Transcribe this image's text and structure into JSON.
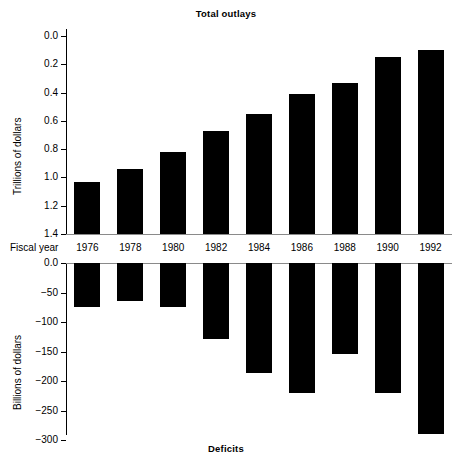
{
  "chart_data": [
    {
      "type": "bar",
      "title": "Total outlays",
      "xlabel": "Fiscal year",
      "ylabel": "Trillions of dollars",
      "categories": [
        "1976",
        "1978",
        "1980",
        "1982",
        "1984",
        "1986",
        "1988",
        "1990",
        "1992"
      ],
      "values": [
        0.37,
        0.46,
        0.58,
        0.73,
        0.85,
        0.99,
        1.07,
        1.25,
        1.3
      ],
      "yticks": [
        "0.0",
        "0.2",
        "0.4",
        "0.6",
        "0.8",
        "1.0",
        "1.2",
        "1.4"
      ],
      "ytick_values": [
        0.0,
        0.2,
        0.4,
        0.6,
        0.8,
        1.0,
        1.2,
        1.4
      ],
      "ylim": [
        0.0,
        1.5
      ],
      "grid": false,
      "legend": "none",
      "bar_color": "#000000"
    },
    {
      "type": "bar",
      "title": "Deficits",
      "xlabel": "Fiscal year",
      "ylabel": "Billions of dollars",
      "categories": [
        "1976",
        "1978",
        "1980",
        "1982",
        "1984",
        "1986",
        "1988",
        "1990",
        "1992"
      ],
      "values": [
        -74,
        -64,
        -74,
        -128,
        -186,
        -221,
        -155,
        -221,
        -290
      ],
      "yticks": [
        "0.0",
        "−50",
        "−100",
        "−150",
        "−200",
        "−250",
        "−300"
      ],
      "ytick_values": [
        0,
        -50,
        -100,
        -150,
        -200,
        -250,
        -300
      ],
      "ylim": [
        -310,
        0
      ],
      "grid": false,
      "legend": "none",
      "bar_color": "#000000"
    }
  ],
  "top": {
    "title": "Total outlays",
    "ylabel": "Trillions of dollars",
    "yticks": [
      "1.4",
      "1.2",
      "1.0",
      "0.8",
      "0.6",
      "0.4",
      "0.2",
      "0.0"
    ]
  },
  "bottom": {
    "title": "Deficits",
    "ylabel": "Billions of dollars",
    "yticks": [
      "0.0",
      "−50",
      "−100",
      "−150",
      "−200",
      "−250",
      "−300"
    ]
  },
  "axis": {
    "fiscal_year_label": "Fiscal year",
    "years": [
      "1976",
      "1978",
      "1980",
      "1982",
      "1984",
      "1986",
      "1988",
      "1990",
      "1992"
    ]
  }
}
